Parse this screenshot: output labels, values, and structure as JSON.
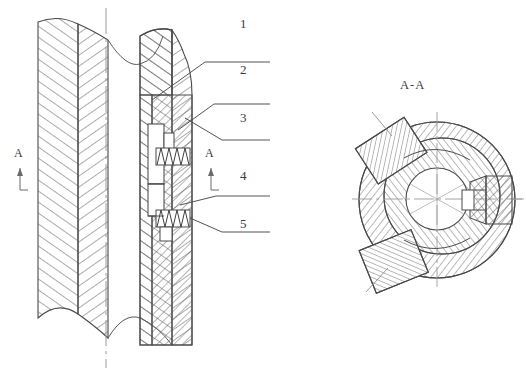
{
  "drawing": {
    "title": "",
    "type": "mechanical-cross-section",
    "background_color": "#ffffff",
    "line_color": "#3a3a3a",
    "hatch_color": "#5a5a5a",
    "views": {
      "longitudinal": {
        "name": "longitudinal-section-view",
        "section_marker_left": "A",
        "section_marker_right": "A",
        "break_line_top": true,
        "break_line_bottom": true
      },
      "cross_section": {
        "name": "cross-section-view",
        "title": "A-A"
      }
    },
    "callouts": [
      {
        "id": "1",
        "label": "1"
      },
      {
        "id": "2",
        "label": "2"
      },
      {
        "id": "3",
        "label": "3"
      },
      {
        "id": "4",
        "label": "4"
      },
      {
        "id": "5",
        "label": "5"
      }
    ]
  }
}
